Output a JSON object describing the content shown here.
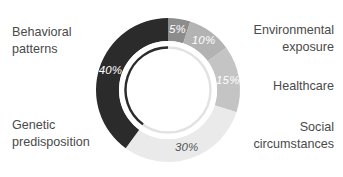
{
  "chart_data": {
    "type": "pie",
    "variant": "donut",
    "title": "",
    "subtitle": "",
    "xlabel": "",
    "ylabel": "",
    "legend_position": "outside-labels",
    "grid": false,
    "units": "%",
    "start_angle_deg": 0,
    "direction": "clockwise",
    "categories": [
      "Environmental exposure",
      "Healthcare",
      "Social circumstances",
      "Genetic predisposition",
      "Behavioral patterns"
    ],
    "values": [
      5,
      10,
      15,
      30,
      40
    ],
    "value_labels": [
      "5%",
      "10%",
      "15%",
      "30%",
      "40%"
    ],
    "colors": [
      "#8c8c8c",
      "#b3b3b3",
      "#c4c4c4",
      "#eaeaea",
      "#2b2b2b"
    ],
    "value_label_colors": [
      "#ffffff",
      "#ffffff",
      "#ffffff",
      "#545454",
      "#ffffff"
    ],
    "slices": [
      {
        "name": "Environmental exposure",
        "value": 5,
        "value_label": "5%",
        "color": "#8c8c8c",
        "value_label_color": "#ffffff"
      },
      {
        "name": "Healthcare",
        "value": 10,
        "value_label": "10%",
        "color": "#b3b3b3",
        "value_label_color": "#ffffff"
      },
      {
        "name": "Social circumstances",
        "value": 15,
        "value_label": "15%",
        "color": "#c4c4c4",
        "value_label_color": "#ffffff"
      },
      {
        "name": "Genetic predisposition",
        "value": 30,
        "value_label": "30%",
        "color": "#eaeaea",
        "value_label_color": "#545454"
      },
      {
        "name": "Behavioral patterns",
        "value": 40,
        "value_label": "40%",
        "color": "#2b2b2b",
        "value_label_color": "#ffffff"
      }
    ],
    "inner_ring": {
      "dark_arc_color": "#2b2b2b",
      "light_arc_color": "#e2e2e2"
    }
  },
  "labels": {
    "behavioral": "Behavioral\npatterns",
    "genetic": "Genetic\npredisposition",
    "environmental": "Environmental\nexposure",
    "healthcare": "Healthcare",
    "social": "Social\ncircumstances"
  },
  "values": {
    "behavioral": "40%",
    "genetic": "30%",
    "environmental": "5%",
    "healthcare": "10%",
    "social": "15%"
  },
  "style": {
    "background": "#ffffff",
    "label_color": "#4a4a4a"
  }
}
